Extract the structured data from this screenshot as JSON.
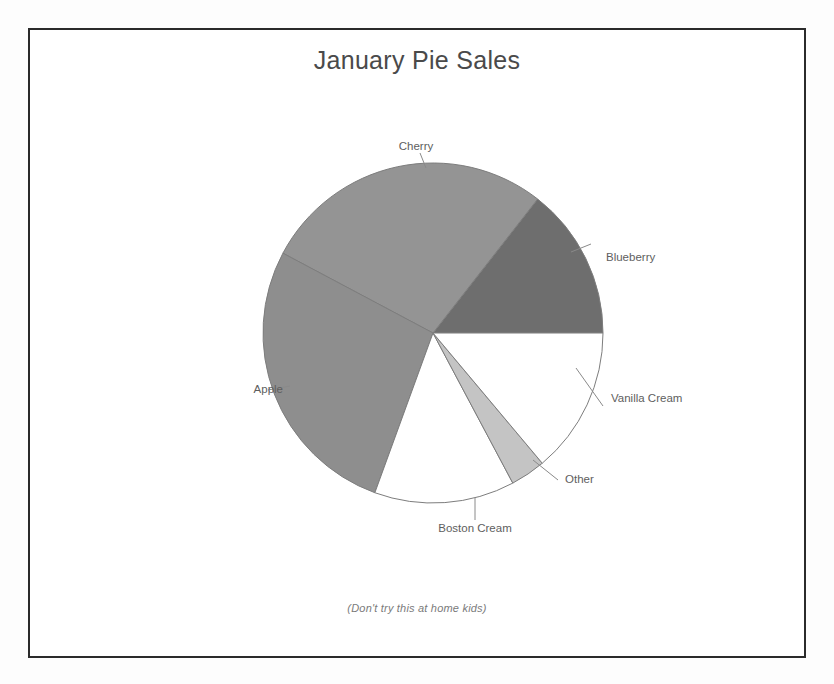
{
  "chart_data": {
    "type": "pie",
    "title": "January Pie Sales",
    "footnote": "(Don't try this at home kids)",
    "labels": [
      "Blueberry",
      "Cherry",
      "Apple",
      "Boston Cream",
      "Other",
      "Vanilla Cream"
    ],
    "values": [
      14.4,
      27.8,
      27.2,
      13.3,
      3.3,
      13.9
    ],
    "units": "percent of January pie sales",
    "legend": "none (labels attached to slices with leader lines)",
    "grid": false,
    "slices": [
      {
        "label": "Blueberry",
        "value": 14.4,
        "start_angle_deg": 0,
        "end_angle_deg": 52,
        "color": "#6e6e6e",
        "label_side": "right"
      },
      {
        "label": "Cherry",
        "value": 27.8,
        "start_angle_deg": 52,
        "end_angle_deg": 152,
        "color": "#949494",
        "label_side": "top"
      },
      {
        "label": "Apple",
        "value": 27.2,
        "start_angle_deg": 152,
        "end_angle_deg": 250,
        "color": "#8e8e8e",
        "label_side": "left"
      },
      {
        "label": "Boston Cream",
        "value": 13.3,
        "start_angle_deg": 250,
        "end_angle_deg": 298,
        "color": "#ffffff",
        "label_side": "bottom"
      },
      {
        "label": "Other",
        "value": 3.3,
        "start_angle_deg": 298,
        "end_angle_deg": 310,
        "color": "#c4c4c4",
        "label_side": "bottom-right"
      },
      {
        "label": "Vanilla Cream",
        "value": 13.9,
        "start_angle_deg": 310,
        "end_angle_deg": 360,
        "color": "#ffffff",
        "label_side": "right"
      }
    ]
  },
  "labels": {
    "cherry": "Cherry",
    "blueberry": "Blueberry",
    "vanilla_cream": "Vanilla Cream",
    "other": "Other",
    "boston_cream": "Boston Cream",
    "apple": "Apple"
  },
  "colors": {
    "cherry": "#949494",
    "blueberry": "#6e6e6e",
    "apple": "#8e8e8e",
    "boston_cream": "#ffffff",
    "other": "#c4c4c4",
    "vanilla_cream": "#ffffff",
    "outline": "#7d7d7d",
    "frame": "#2b2b2b",
    "title_text": "#4a4a4a",
    "label_text": "#5e5e5e"
  }
}
